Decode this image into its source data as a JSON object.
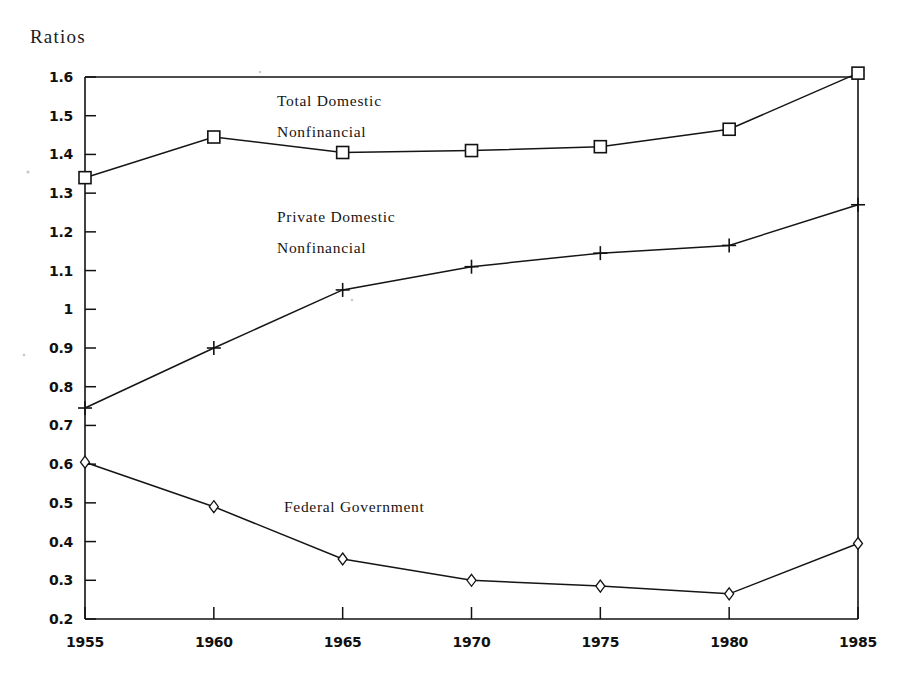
{
  "chart_data": {
    "type": "line",
    "title": "",
    "ylabel": "Ratios",
    "xlabel": "",
    "grid": false,
    "legend_position": "inline-annotations",
    "categories": [
      1955,
      1960,
      1965,
      1970,
      1975,
      1980,
      1985
    ],
    "x": [
      1955,
      1960,
      1965,
      1970,
      1975,
      1980,
      1985
    ],
    "xlim": [
      1955,
      1985
    ],
    "ylim": [
      0.2,
      1.6
    ],
    "y_ticks": [
      "0.2",
      "0.3",
      "0.4",
      "0.5",
      "0.6",
      "0.7",
      "0.8",
      "0.9",
      "1",
      "1.1",
      "1.2",
      "1.3",
      "1.4",
      "1.5",
      "1.6"
    ],
    "y_tick_values": [
      0.2,
      0.3,
      0.4,
      0.5,
      0.6,
      0.7,
      0.8,
      0.9,
      1.0,
      1.1,
      1.2,
      1.3,
      1.4,
      1.5,
      1.6
    ],
    "x_ticks": [
      "1955",
      "1960",
      "1965",
      "1970",
      "1975",
      "1980",
      "1985"
    ],
    "series": [
      {
        "name": "Total Domestic Nonfinancial",
        "marker": "square",
        "label_lines": [
          "Total Domestic",
          "Nonfinancial"
        ],
        "values": [
          1.34,
          1.445,
          1.405,
          1.41,
          1.42,
          1.465,
          1.61
        ]
      },
      {
        "name": "Private Domestic Nonfinancial",
        "marker": "plus",
        "label_lines": [
          "Private Domestic",
          "Nonfinancial"
        ],
        "values": [
          0.745,
          0.9,
          1.05,
          1.11,
          1.145,
          1.165,
          1.27
        ]
      },
      {
        "name": "Federal Government",
        "marker": "diamond",
        "label_lines": [
          "Federal Government"
        ],
        "values": [
          0.605,
          0.49,
          0.355,
          0.3,
          0.285,
          0.265,
          0.395
        ]
      }
    ]
  },
  "annotations": {
    "total_domestic_line1": "Total Domestic",
    "total_domestic_line2": "Nonfinancial",
    "private_domestic_line1": "Private Domestic",
    "private_domestic_line2": "Nonfinancial",
    "federal_government": "Federal Government"
  },
  "axis": {
    "y_axis_caption": "Ratios"
  },
  "colors": {
    "ink": "#121212",
    "background": "#ffffff",
    "marker_fill": "#ffffff"
  }
}
